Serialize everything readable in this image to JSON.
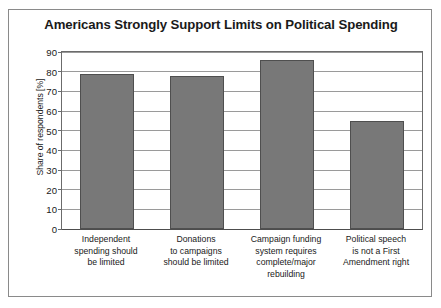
{
  "chart_data": {
    "type": "bar",
    "title": "Americans Strongly Support Limits on Political Spending",
    "xlabel": "",
    "ylabel": "Share of respondents [%]",
    "ylim": [
      0,
      90
    ],
    "yticks": [
      0,
      10,
      20,
      30,
      40,
      50,
      60,
      70,
      80,
      90
    ],
    "grid": true,
    "legend": "none",
    "bar_color": "#787878",
    "categories": [
      "Independent spending should be limited",
      "Donations to campaigns should be limited",
      "Campaign funding system requires complete/major rebuilding",
      "Political speech is not a First Amendment right"
    ],
    "category_lines": [
      [
        "Independent",
        "spending should",
        "be limited"
      ],
      [
        "Donations",
        "to campaigns",
        "should be limited"
      ],
      [
        "Campaign funding",
        "system requires",
        "complete/major",
        "rebuilding"
      ],
      [
        "Political speech",
        "is not a First",
        "Amendment right"
      ]
    ],
    "values": [
      79,
      78,
      86,
      55
    ]
  }
}
